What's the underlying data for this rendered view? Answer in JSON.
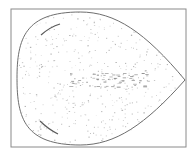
{
  "figure": {
    "colors": {
      "background": "#ffffff",
      "frame": "#8a8a8a",
      "outline": "#6e6e6e",
      "stipple": "#9a9a9a",
      "band": "#7a7a7a",
      "stroke": "#5a5a5a"
    },
    "frame": {
      "x": 11,
      "y": 9,
      "width": 175,
      "height": 138
    },
    "drop": {
      "left_x": 17,
      "top_y": 12,
      "bottom_y": 145,
      "tip_x": 185,
      "tip_y": 80
    },
    "stipple_seed": 7,
    "stipple_count": 420,
    "band_dash_count": 70
  }
}
